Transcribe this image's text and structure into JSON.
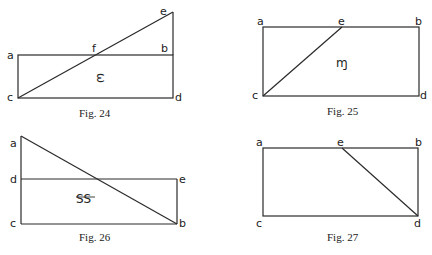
{
  "figures": [
    {
      "caption": "Fig. 24",
      "labels": {
        "a": "a",
        "b": "b",
        "c": "c",
        "d": "d",
        "e": "e",
        "f": "f"
      },
      "symbol": "ς",
      "description": "Rectangle abdc with line from c to e (above b), crossing ab at f"
    },
    {
      "caption": "Fig. 25",
      "labels": {
        "a": "a",
        "b": "b",
        "c": "c",
        "d": "d",
        "e": "e"
      },
      "symbol": "ɱ",
      "description": "Rectangle abdc with line from c to point e on ab"
    },
    {
      "caption": "Fig. 26",
      "labels": {
        "a": "a",
        "b": "b",
        "c": "c",
        "d": "d",
        "e": "e"
      },
      "symbol": "SS",
      "description": "Rectangle decb with line from a (above d) to b"
    },
    {
      "caption": "Fig. 27",
      "labels": {
        "a": "a",
        "b": "b",
        "c": "c",
        "d": "d",
        "e": "e"
      },
      "symbol": "",
      "description": "Rectangle abdc with line from e on ab to d"
    }
  ]
}
